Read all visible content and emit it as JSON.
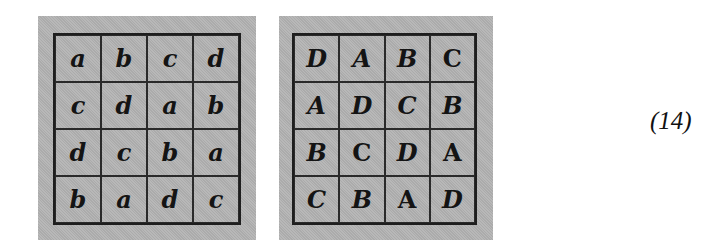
{
  "figure": {
    "grid_lowercase": {
      "rows": [
        [
          "a",
          "b",
          "c",
          "d"
        ],
        [
          "c",
          "d",
          "a",
          "b"
        ],
        [
          "d",
          "c",
          "b",
          "a"
        ],
        [
          "b",
          "a",
          "d",
          "c"
        ]
      ]
    },
    "grid_uppercase": {
      "rows": [
        [
          "D",
          "A",
          "B",
          "C"
        ],
        [
          "A",
          "D",
          "C",
          "B"
        ],
        [
          "B",
          "C",
          "D",
          "A"
        ],
        [
          "C",
          "B",
          "A",
          "D"
        ]
      ],
      "italic": [
        [
          true,
          true,
          true,
          false
        ],
        [
          true,
          true,
          true,
          true
        ],
        [
          true,
          false,
          true,
          false
        ],
        [
          true,
          true,
          false,
          true
        ]
      ]
    },
    "equation_label": "(14)"
  },
  "colors": {
    "cell_fill": "#b4b4b4",
    "grid_line": "#1e1e1e"
  }
}
